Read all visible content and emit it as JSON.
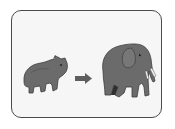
{
  "illustration": {
    "description": "Small animal transforms into large elephant",
    "left_figure": "young-animal",
    "connector": "right-arrow",
    "right_figure": "adult-elephant",
    "colors": {
      "card_background": "#f6f6f6",
      "card_border": "#4a4a4a",
      "animal_fill": "#6b6b6b",
      "animal_dark": "#3e3e3e",
      "arrow": "#5e5e5e",
      "tusk": "#f4f4f4"
    }
  }
}
